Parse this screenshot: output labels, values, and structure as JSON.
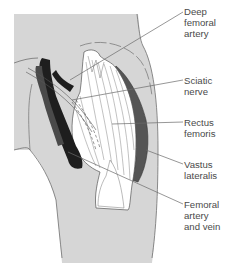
{
  "diagram": {
    "labels": [
      {
        "id": "deep-femoral-artery",
        "text": "Deep\nfemoral\nartery"
      },
      {
        "id": "sciatic-nerve",
        "text": "Sciatic\nnerve"
      },
      {
        "id": "rectus-femoris",
        "text": "Rectus\nfemoris"
      },
      {
        "id": "vastus-lateralis",
        "text": "Vastus\nlateralis"
      },
      {
        "id": "femoral-artery-and-vein",
        "text": "Femoral\nartery\nand vein"
      }
    ],
    "colors": {
      "skin": "#d6d6d6",
      "outline": "#707070",
      "vessel_dark": "#1e1e1e",
      "vessel_mid": "#4a4a4a",
      "muscle_dark": "#555555",
      "muscle_light": "#ffffff",
      "leader_line": "#6a6a6a",
      "label_text": "#4a4a4a"
    }
  }
}
